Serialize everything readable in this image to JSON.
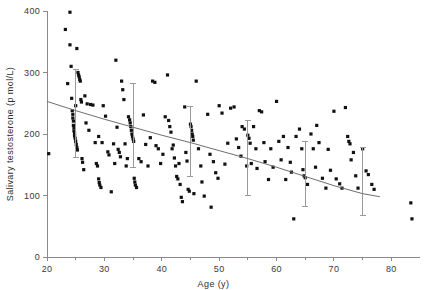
{
  "chart_data": {
    "type": "scatter",
    "title": "",
    "xlabel": "Age (y)",
    "ylabel": "Salivary testosterone (p mol/L)",
    "xlim": [
      20,
      85
    ],
    "ylim": [
      0,
      400
    ],
    "xticks": [
      20,
      30,
      40,
      50,
      60,
      70,
      80
    ],
    "xticks_minor": [
      25,
      35,
      45,
      55,
      65,
      75
    ],
    "yticks": [
      0,
      100,
      200,
      300,
      400
    ],
    "grid": false,
    "legend": "none",
    "point_color": "#111111",
    "line_color": "#6e6e6e",
    "errorbar_color": "#9a9a9a",
    "axis_color": "#8a8a8a",
    "points": [
      [
        20.3,
        168
      ],
      [
        23.2,
        370
      ],
      [
        23.6,
        282
      ],
      [
        24.0,
        398
      ],
      [
        24.0,
        345
      ],
      [
        24.2,
        310
      ],
      [
        24.3,
        258
      ],
      [
        24.4,
        238
      ],
      [
        24.5,
        232
      ],
      [
        24.5,
        226
      ],
      [
        24.6,
        221
      ],
      [
        24.6,
        214
      ],
      [
        24.7,
        210
      ],
      [
        24.7,
        205
      ],
      [
        24.8,
        201
      ],
      [
        24.8,
        197
      ],
      [
        24.9,
        193
      ],
      [
        25.0,
        246
      ],
      [
        25.0,
        188
      ],
      [
        25.1,
        183
      ],
      [
        25.2,
        178
      ],
      [
        25.3,
        174
      ],
      [
        25.4,
        300
      ],
      [
        25.5,
        296
      ],
      [
        25.6,
        293
      ],
      [
        25.7,
        289
      ],
      [
        25.8,
        286
      ],
      [
        25.2,
        339
      ],
      [
        25.9,
        256
      ],
      [
        26.0,
        252
      ],
      [
        26.1,
        160
      ],
      [
        26.2,
        154
      ],
      [
        26.4,
        142
      ],
      [
        26.6,
        262
      ],
      [
        26.8,
        218
      ],
      [
        27.0,
        249
      ],
      [
        27.3,
        206
      ],
      [
        27.6,
        248
      ],
      [
        28.0,
        247
      ],
      [
        28.4,
        186
      ],
      [
        28.6,
        152
      ],
      [
        28.8,
        148
      ],
      [
        29.0,
        196
      ],
      [
        29.0,
        127
      ],
      [
        29.1,
        121
      ],
      [
        29.2,
        117
      ],
      [
        29.4,
        113
      ],
      [
        29.6,
        186
      ],
      [
        29.8,
        246
      ],
      [
        30.2,
        229
      ],
      [
        30.6,
        171
      ],
      [
        30.8,
        166
      ],
      [
        31.2,
        106
      ],
      [
        31.6,
        184
      ],
      [
        31.8,
        152
      ],
      [
        32.0,
        320
      ],
      [
        32.2,
        211
      ],
      [
        32.4,
        175
      ],
      [
        32.6,
        170
      ],
      [
        32.8,
        163
      ],
      [
        33.0,
        286
      ],
      [
        33.2,
        272
      ],
      [
        33.4,
        256
      ],
      [
        33.6,
        184
      ],
      [
        33.8,
        148
      ],
      [
        34.0,
        160
      ],
      [
        34.2,
        228
      ],
      [
        34.4,
        223
      ],
      [
        34.5,
        218
      ],
      [
        34.6,
        212
      ],
      [
        34.7,
        206
      ],
      [
        34.8,
        200
      ],
      [
        34.9,
        196
      ],
      [
        35.0,
        192
      ],
      [
        35.1,
        188
      ],
      [
        35.2,
        128
      ],
      [
        35.3,
        122
      ],
      [
        35.4,
        117
      ],
      [
        35.6,
        113
      ],
      [
        36.0,
        160
      ],
      [
        36.4,
        155
      ],
      [
        36.8,
        231
      ],
      [
        37.2,
        183
      ],
      [
        37.6,
        148
      ],
      [
        38.0,
        194
      ],
      [
        38.4,
        286
      ],
      [
        38.8,
        284
      ],
      [
        39.0,
        181
      ],
      [
        39.4,
        176
      ],
      [
        39.8,
        152
      ],
      [
        40.2,
        167
      ],
      [
        40.6,
        228
      ],
      [
        41.0,
        296
      ],
      [
        41.2,
        222
      ],
      [
        41.4,
        212
      ],
      [
        41.6,
        203
      ],
      [
        41.8,
        176
      ],
      [
        42.0,
        182
      ],
      [
        42.2,
        161
      ],
      [
        42.4,
        148
      ],
      [
        42.6,
        131
      ],
      [
        42.8,
        127
      ],
      [
        43.0,
        152
      ],
      [
        43.2,
        118
      ],
      [
        43.4,
        97
      ],
      [
        43.6,
        90
      ],
      [
        44.0,
        244
      ],
      [
        44.2,
        170
      ],
      [
        44.4,
        156
      ],
      [
        44.6,
        110
      ],
      [
        44.8,
        107
      ],
      [
        45.0,
        216
      ],
      [
        45.1,
        212
      ],
      [
        45.2,
        206
      ],
      [
        45.3,
        200
      ],
      [
        45.4,
        196
      ],
      [
        45.5,
        190
      ],
      [
        45.6,
        103
      ],
      [
        46.0,
        286
      ],
      [
        46.4,
        176
      ],
      [
        46.8,
        148
      ],
      [
        47.0,
        122
      ],
      [
        47.4,
        99
      ],
      [
        48.0,
        232
      ],
      [
        48.4,
        167
      ],
      [
        48.6,
        81
      ],
      [
        49.0,
        155
      ],
      [
        49.4,
        137
      ],
      [
        49.8,
        128
      ],
      [
        50.0,
        246
      ],
      [
        50.5,
        234
      ],
      [
        51.0,
        151
      ],
      [
        51.5,
        185
      ],
      [
        52.0,
        242
      ],
      [
        52.6,
        244
      ],
      [
        53.0,
        192
      ],
      [
        53.4,
        178
      ],
      [
        53.8,
        164
      ],
      [
        54.0,
        212
      ],
      [
        54.4,
        208
      ],
      [
        54.8,
        148
      ],
      [
        55.0,
        198
      ],
      [
        55.2,
        193
      ],
      [
        55.4,
        185
      ],
      [
        55.6,
        152
      ],
      [
        56.0,
        212
      ],
      [
        56.4,
        176
      ],
      [
        56.6,
        144
      ],
      [
        57.0,
        238
      ],
      [
        57.4,
        236
      ],
      [
        57.8,
        186
      ],
      [
        58.0,
        155
      ],
      [
        58.6,
        126
      ],
      [
        59.0,
        176
      ],
      [
        59.4,
        146
      ],
      [
        60.0,
        253
      ],
      [
        60.4,
        188
      ],
      [
        60.8,
        158
      ],
      [
        61.2,
        196
      ],
      [
        61.6,
        126
      ],
      [
        62.0,
        178
      ],
      [
        62.4,
        154
      ],
      [
        62.6,
        138
      ],
      [
        63.0,
        62
      ],
      [
        63.4,
        196
      ],
      [
        64.0,
        208
      ],
      [
        64.4,
        176
      ],
      [
        64.6,
        142
      ],
      [
        64.8,
        132
      ],
      [
        65.0,
        129
      ],
      [
        65.4,
        118
      ],
      [
        66.0,
        200
      ],
      [
        66.4,
        176
      ],
      [
        66.8,
        146
      ],
      [
        67.0,
        214
      ],
      [
        67.4,
        186
      ],
      [
        68.0,
        128
      ],
      [
        68.6,
        112
      ],
      [
        69.0,
        175
      ],
      [
        69.4,
        141
      ],
      [
        70.0,
        237
      ],
      [
        70.4,
        127
      ],
      [
        71.0,
        119
      ],
      [
        71.4,
        112
      ],
      [
        72.0,
        243
      ],
      [
        72.4,
        196
      ],
      [
        72.6,
        188
      ],
      [
        72.8,
        184
      ],
      [
        73.0,
        158
      ],
      [
        73.4,
        170
      ],
      [
        73.8,
        132
      ],
      [
        74.2,
        112
      ],
      [
        75.0,
        176
      ],
      [
        75.6,
        140
      ],
      [
        76.0,
        134
      ],
      [
        76.6,
        118
      ],
      [
        77.0,
        110
      ],
      [
        83.4,
        88
      ],
      [
        83.6,
        62
      ]
    ],
    "fitted_curve": {
      "label": "fitted regression curve",
      "x": [
        20,
        25,
        30,
        35,
        40,
        45,
        50,
        55,
        60,
        65,
        70,
        75,
        78
      ],
      "y": [
        253,
        238,
        224,
        211,
        198,
        186,
        173,
        160,
        146,
        131,
        116,
        103,
        98
      ]
    },
    "error_bars": [
      {
        "x": 25,
        "y": 238,
        "lower": 161,
        "upper": 305
      },
      {
        "x": 35,
        "y": 210,
        "lower": 146,
        "upper": 282
      },
      {
        "x": 45,
        "y": 186,
        "lower": 131,
        "upper": 244
      },
      {
        "x": 55,
        "y": 160,
        "lower": 100,
        "upper": 222
      },
      {
        "x": 65,
        "y": 135,
        "lower": 82,
        "upper": 188
      },
      {
        "x": 75,
        "y": 120,
        "lower": 68,
        "upper": 178
      }
    ]
  }
}
